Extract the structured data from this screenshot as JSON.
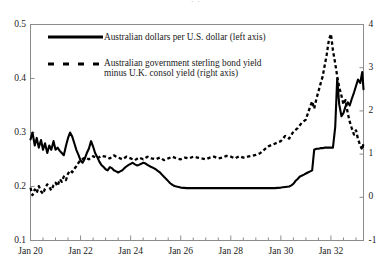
{
  "figure": {
    "cut_off_header": "· ·",
    "background": "#ffffff",
    "ink": "#000000"
  },
  "legend": {
    "position": "inside-top-left",
    "entries": [
      {
        "sample": "solid-line",
        "label": "Australian dollars per U.S. dollar (left axis)",
        "lines": [
          "Australian dollars per U.S. dollar (left axis)"
        ]
      },
      {
        "sample": "dashed-line",
        "label": "Australian government sterling bond yield minus U.K. consol yield (right axis)",
        "lines": [
          "Australian government sterling bond yield",
          "minus U.K. consol yield (right axis)"
        ]
      }
    ]
  },
  "chart_data": {
    "type": "line",
    "title": "",
    "xlabel": "",
    "grid": false,
    "legend_position": "upper left (inside axes)",
    "x_axis": {
      "ticklabels": [
        "Jan 20",
        "Jan 22",
        "Jan 24",
        "Jan 26",
        "Jan 28",
        "Jan 30",
        "Jan 32"
      ],
      "tickvalues": [
        1920.0,
        1922.0,
        1924.0,
        1926.0,
        1928.0,
        1930.0,
        1932.0
      ],
      "minor_tick_interval_years": 0.5,
      "xlim": [
        1920.0,
        1933.3
      ]
    },
    "y_axis_left": {
      "label": "Australian dollars per U.S. dollar",
      "ticklabels": [
        "0.1",
        "0.2",
        "0.3",
        "0.4",
        "0.5"
      ],
      "tickvalues": [
        0.1,
        0.2,
        0.3,
        0.4,
        0.5
      ],
      "ylim": [
        0.1,
        0.5
      ]
    },
    "y_axis_right": {
      "label": "Australian government sterling bond yield minus U.K. consol yield",
      "ticklabels": [
        "-1",
        "0",
        "1",
        "2",
        "3",
        "4"
      ],
      "tickvalues": [
        -1,
        0,
        1,
        2,
        3,
        4
      ],
      "ylim": [
        -1,
        4
      ]
    },
    "series": [
      {
        "name": "Australian dollars per U.S. dollar (left axis)",
        "axis": "left",
        "style": "solid",
        "color": "#000000",
        "x": [
          1920.0,
          1920.08,
          1920.17,
          1920.25,
          1920.33,
          1920.42,
          1920.5,
          1920.58,
          1920.67,
          1920.75,
          1920.83,
          1920.92,
          1921.0,
          1921.08,
          1921.17,
          1921.25,
          1921.33,
          1921.42,
          1921.5,
          1921.58,
          1921.67,
          1921.75,
          1921.83,
          1921.92,
          1922.0,
          1922.08,
          1922.17,
          1922.25,
          1922.33,
          1922.42,
          1922.5,
          1922.58,
          1922.67,
          1922.75,
          1922.83,
          1922.92,
          1923.0,
          1923.08,
          1923.17,
          1923.25,
          1923.33,
          1923.42,
          1923.5,
          1923.58,
          1923.67,
          1923.75,
          1923.83,
          1923.92,
          1924.0,
          1924.08,
          1924.17,
          1924.25,
          1924.33,
          1924.42,
          1924.5,
          1924.58,
          1924.67,
          1924.75,
          1924.83,
          1924.92,
          1925.0,
          1925.08,
          1925.17,
          1925.25,
          1925.33,
          1925.42,
          1925.5,
          1925.58,
          1925.67,
          1925.75,
          1925.83,
          1925.92,
          1926.0,
          1926.25,
          1926.5,
          1926.75,
          1927.0,
          1927.25,
          1927.5,
          1927.75,
          1928.0,
          1928.25,
          1928.5,
          1928.75,
          1929.0,
          1929.25,
          1929.5,
          1929.75,
          1930.0,
          1930.17,
          1930.33,
          1930.42,
          1930.5,
          1930.58,
          1930.67,
          1930.75,
          1930.83,
          1930.92,
          1931.0,
          1931.08,
          1931.17,
          1931.25,
          1931.33,
          1931.42,
          1931.5,
          1931.58,
          1931.67,
          1931.75,
          1931.83,
          1931.92,
          1932.0,
          1932.08,
          1932.17,
          1932.25,
          1932.33,
          1932.42,
          1932.5,
          1932.58,
          1932.67,
          1932.75,
          1932.83,
          1932.92,
          1933.0,
          1933.08,
          1933.17,
          1933.25,
          1933.3
        ],
        "y": [
          0.287,
          0.3,
          0.276,
          0.29,
          0.272,
          0.286,
          0.268,
          0.28,
          0.262,
          0.276,
          0.268,
          0.284,
          0.268,
          0.272,
          0.266,
          0.262,
          0.258,
          0.276,
          0.29,
          0.3,
          0.292,
          0.28,
          0.268,
          0.258,
          0.248,
          0.244,
          0.252,
          0.262,
          0.27,
          0.284,
          0.274,
          0.262,
          0.254,
          0.246,
          0.24,
          0.236,
          0.232,
          0.23,
          0.236,
          0.234,
          0.23,
          0.228,
          0.226,
          0.228,
          0.23,
          0.234,
          0.237,
          0.24,
          0.242,
          0.244,
          0.241,
          0.239,
          0.24,
          0.242,
          0.244,
          0.243,
          0.24,
          0.238,
          0.236,
          0.234,
          0.232,
          0.229,
          0.226,
          0.222,
          0.218,
          0.214,
          0.21,
          0.206,
          0.203,
          0.201,
          0.2,
          0.199,
          0.198,
          0.197,
          0.197,
          0.197,
          0.197,
          0.197,
          0.197,
          0.197,
          0.197,
          0.197,
          0.197,
          0.197,
          0.197,
          0.197,
          0.197,
          0.197,
          0.198,
          0.199,
          0.2,
          0.202,
          0.205,
          0.21,
          0.214,
          0.218,
          0.22,
          0.222,
          0.224,
          0.226,
          0.228,
          0.23,
          0.268,
          0.27,
          0.27,
          0.271,
          0.271,
          0.272,
          0.272,
          0.272,
          0.272,
          0.272,
          0.31,
          0.4,
          0.352,
          0.33,
          0.336,
          0.348,
          0.356,
          0.35,
          0.362,
          0.374,
          0.386,
          0.398,
          0.392,
          0.412,
          0.38
        ],
        "notes": "Flat near 0.197 from about 1926 through 1929; step up in mid-1931 and a sharp jump in early 1932 with a peak near 0.40, then volatile 0.33-0.41 through 1933."
      },
      {
        "name": "Australian government sterling bond yield minus U.K. consol yield (right axis)",
        "axis": "right",
        "style": "dashed",
        "color": "#000000",
        "x": [
          1920.0,
          1920.08,
          1920.17,
          1920.25,
          1920.33,
          1920.42,
          1920.5,
          1920.58,
          1920.67,
          1920.75,
          1920.83,
          1920.92,
          1921.0,
          1921.08,
          1921.17,
          1921.25,
          1921.33,
          1921.42,
          1921.5,
          1921.58,
          1921.67,
          1921.75,
          1921.83,
          1921.92,
          1922.0,
          1922.17,
          1922.33,
          1922.5,
          1922.67,
          1922.83,
          1923.0,
          1923.17,
          1923.33,
          1923.5,
          1923.67,
          1923.83,
          1924.0,
          1924.17,
          1924.33,
          1924.5,
          1924.67,
          1924.83,
          1925.0,
          1925.17,
          1925.33,
          1925.5,
          1925.67,
          1925.83,
          1926.0,
          1926.17,
          1926.33,
          1926.5,
          1926.67,
          1926.83,
          1927.0,
          1927.17,
          1927.33,
          1927.5,
          1927.67,
          1927.83,
          1928.0,
          1928.17,
          1928.33,
          1928.5,
          1928.67,
          1928.83,
          1929.0,
          1929.17,
          1929.33,
          1929.5,
          1929.67,
          1929.83,
          1930.0,
          1930.17,
          1930.33,
          1930.5,
          1930.67,
          1930.83,
          1931.0,
          1931.08,
          1931.17,
          1931.25,
          1931.33,
          1931.42,
          1931.5,
          1931.58,
          1931.67,
          1931.75,
          1931.83,
          1931.92,
          1932.0,
          1932.08,
          1932.17,
          1932.25,
          1932.33,
          1932.42,
          1932.5,
          1932.58,
          1932.67,
          1932.75,
          1932.83,
          1932.92,
          1933.0,
          1933.08,
          1933.17,
          1933.25,
          1933.3
        ],
        "y": [
          0.22,
          0.05,
          0.18,
          0.1,
          0.26,
          0.14,
          0.08,
          0.2,
          0.3,
          0.24,
          0.16,
          0.28,
          0.34,
          0.26,
          0.42,
          0.36,
          0.48,
          0.4,
          0.55,
          0.62,
          0.58,
          0.66,
          0.72,
          0.8,
          0.86,
          0.92,
          0.88,
          0.95,
          0.9,
          0.96,
          0.94,
          0.9,
          0.97,
          0.92,
          0.88,
          0.94,
          0.9,
          0.86,
          0.92,
          0.88,
          0.94,
          0.9,
          0.88,
          0.92,
          0.86,
          0.9,
          0.94,
          0.9,
          0.88,
          0.92,
          0.9,
          0.94,
          0.92,
          0.9,
          0.88,
          0.92,
          0.94,
          0.9,
          0.92,
          0.96,
          0.94,
          0.9,
          0.95,
          0.92,
          0.94,
          0.96,
          0.98,
          1.02,
          1.1,
          1.18,
          1.22,
          1.26,
          1.3,
          1.42,
          1.36,
          1.52,
          1.6,
          1.72,
          1.8,
          1.95,
          2.1,
          2.22,
          2.05,
          2.28,
          2.45,
          2.62,
          2.8,
          3.05,
          3.3,
          3.65,
          3.78,
          3.4,
          3.1,
          2.8,
          2.55,
          2.35,
          2.15,
          2.25,
          1.95,
          1.75,
          1.6,
          1.45,
          1.55,
          1.35,
          1.2,
          1.1,
          1.25
        ],
        "notes": "Hovers near 0.1-1.0 through the 1920s, then rises steeply from 1930, peaking near 3.8 in early 1932 before falling back toward 1.1-1.5 by 1933."
      }
    ]
  }
}
